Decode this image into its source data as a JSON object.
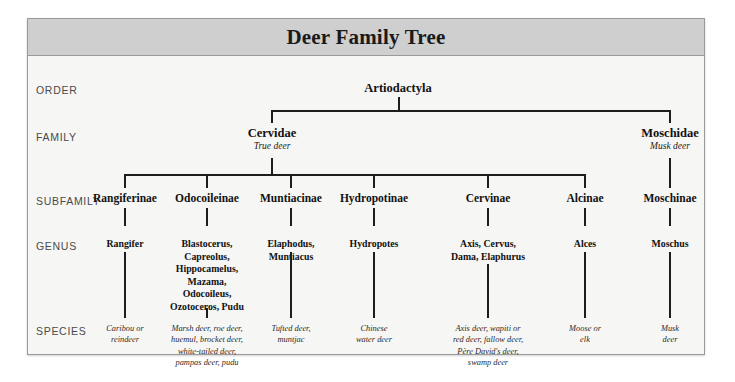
{
  "title": "Deer Family Tree",
  "row_labels": [
    {
      "key": "order",
      "label": "ORDER"
    },
    {
      "key": "family",
      "label": "FAMILY"
    },
    {
      "key": "subfamily",
      "label": "SUBFAMILY"
    },
    {
      "key": "genus",
      "label": "GENUS"
    },
    {
      "key": "species",
      "label": "SPECIES"
    }
  ],
  "order": {
    "name": "Artiodactyla"
  },
  "families": [
    {
      "name": "Cervidae",
      "common": "True deer"
    },
    {
      "name": "Moschidae",
      "common": "Musk deer"
    }
  ],
  "subfamilies": [
    {
      "name": "Rangiferinae"
    },
    {
      "name": "Odocoileinae"
    },
    {
      "name": "Muntiacinae"
    },
    {
      "name": "Hydropotinae"
    },
    {
      "name": "Cervinae"
    },
    {
      "name": "Alcinae"
    },
    {
      "name": "Moschinae"
    }
  ],
  "genera": [
    {
      "lines": [
        "Rangifer"
      ]
    },
    {
      "lines": [
        "Blastocerus,",
        "Capreolus,",
        "Hippocamelus,",
        "Mazama,",
        "Odocoileus,",
        "Ozotoceros, Pudu"
      ]
    },
    {
      "lines": [
        "Elaphodus,",
        "Muntiacus"
      ]
    },
    {
      "lines": [
        "Hydropotes"
      ]
    },
    {
      "lines": [
        "Axis, Cervus,",
        "Dama, Elaphurus"
      ]
    },
    {
      "lines": [
        "Alces"
      ]
    },
    {
      "lines": [
        "Moschus"
      ]
    }
  ],
  "species": [
    {
      "lines": [
        "Caribou or",
        "reindeer"
      ]
    },
    {
      "lines": [
        "Marsh deer, roe deer,",
        "huemul, brocket deer,",
        "white-tailed deer,",
        "pampas deer, pudu"
      ]
    },
    {
      "lines": [
        "Tufted deer,",
        "muntjac"
      ]
    },
    {
      "lines": [
        "Chinese",
        "water deer"
      ]
    },
    {
      "lines": [
        "Axis deer, wapiti or",
        "red deer, fallow deer,",
        "Père David's deer,",
        "swamp deer"
      ]
    },
    {
      "lines": [
        "Moose or",
        "elk"
      ]
    },
    {
      "lines": [
        "Musk deer"
      ]
    }
  ],
  "colors": {
    "panel_background": "#f5f5f4",
    "title_band": "#cfcfcf",
    "border": "#9a9a9a",
    "line": "#1d1d1d",
    "row_label_text": "#4a4a4a",
    "node_text": "#111111"
  }
}
